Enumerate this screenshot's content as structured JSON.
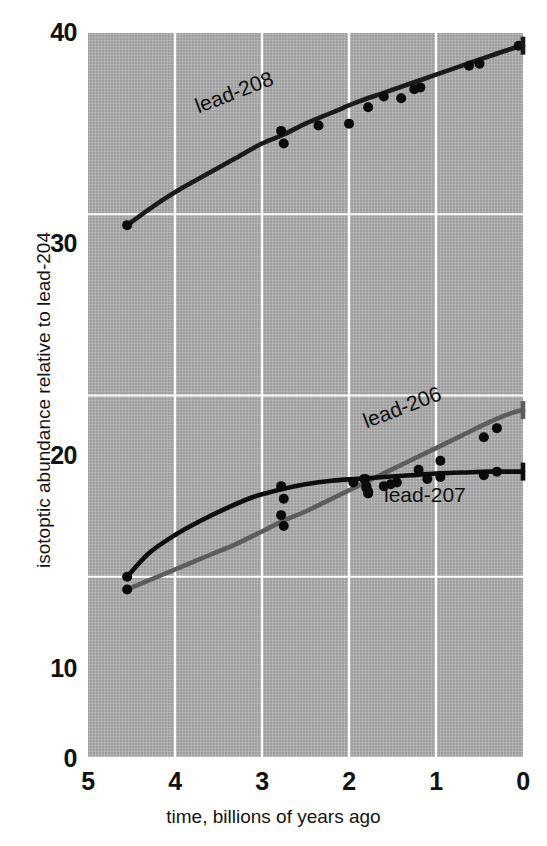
{
  "chart_data": {
    "type": "line",
    "title": "",
    "xlabel": "time, billions of years ago",
    "ylabel": "isotoptic abundance relative to lead-204",
    "xlim": [
      5,
      0
    ],
    "ylim": [
      0,
      40
    ],
    "x_ticks": [
      "5",
      "4",
      "3",
      "2",
      "1",
      "0"
    ],
    "x_tick_values": [
      5,
      4,
      3,
      2,
      1,
      0
    ],
    "y_ticks": [
      "0",
      "10",
      "20",
      "30",
      "40"
    ],
    "y_tick_values": [
      0,
      10,
      20,
      30,
      40
    ],
    "x_axis_reversed": true,
    "grid": true,
    "grid_color": "#ffffff",
    "panel_background": "#a9a9a9",
    "legend": "inline-labels",
    "series": [
      {
        "name": "lead-208",
        "label": "lead-208",
        "color": "#1b1b1b",
        "curve": [
          [
            4.55,
            29.4
          ],
          [
            4.2,
            30.6
          ],
          [
            3.9,
            31.5
          ],
          [
            3.6,
            32.3
          ],
          [
            3.3,
            33.1
          ],
          [
            3.0,
            33.9
          ],
          [
            2.75,
            34.4
          ],
          [
            2.5,
            35.0
          ],
          [
            2.2,
            35.6
          ],
          [
            1.9,
            36.2
          ],
          [
            1.6,
            36.7
          ],
          [
            1.3,
            37.2
          ],
          [
            1.0,
            37.7
          ],
          [
            0.7,
            38.2
          ],
          [
            0.4,
            38.7
          ],
          [
            0.15,
            39.1
          ],
          [
            0.0,
            39.3
          ]
        ],
        "points": [
          [
            4.55,
            29.4
          ],
          [
            2.78,
            34.6
          ],
          [
            2.75,
            33.9
          ],
          [
            2.35,
            34.9
          ],
          [
            2.0,
            35.0
          ],
          [
            1.78,
            35.9
          ],
          [
            1.6,
            36.5
          ],
          [
            1.4,
            36.4
          ],
          [
            1.25,
            36.9
          ],
          [
            1.18,
            37.0
          ],
          [
            0.62,
            38.2
          ],
          [
            0.5,
            38.3
          ],
          [
            0.05,
            39.3
          ]
        ]
      },
      {
        "name": "lead-206",
        "label": "lead-206",
        "color": "#5d5d5d",
        "curve": [
          [
            4.55,
            9.3
          ],
          [
            4.2,
            10.0
          ],
          [
            3.9,
            10.6
          ],
          [
            3.6,
            11.2
          ],
          [
            3.3,
            11.8
          ],
          [
            3.0,
            12.5
          ],
          [
            2.75,
            13.1
          ],
          [
            2.5,
            13.6
          ],
          [
            2.2,
            14.3
          ],
          [
            1.9,
            15.0
          ],
          [
            1.6,
            15.7
          ],
          [
            1.3,
            16.4
          ],
          [
            1.0,
            17.1
          ],
          [
            0.7,
            17.8
          ],
          [
            0.4,
            18.5
          ],
          [
            0.15,
            19.0
          ],
          [
            0.0,
            19.2
          ]
        ],
        "points": [
          [
            4.55,
            9.3
          ],
          [
            2.78,
            13.4
          ],
          [
            2.75,
            12.8
          ],
          [
            1.82,
            15.4
          ],
          [
            1.8,
            15.0
          ],
          [
            1.78,
            14.7
          ],
          [
            1.52,
            15.1
          ],
          [
            1.2,
            15.9
          ],
          [
            0.95,
            16.4
          ],
          [
            0.45,
            17.7
          ],
          [
            0.3,
            18.2
          ]
        ]
      },
      {
        "name": "lead-207",
        "label": "lead-207",
        "color": "#0d0d0d",
        "curve": [
          [
            4.55,
            10.0
          ],
          [
            4.3,
            11.3
          ],
          [
            4.0,
            12.3
          ],
          [
            3.7,
            13.1
          ],
          [
            3.4,
            13.8
          ],
          [
            3.1,
            14.4
          ],
          [
            2.8,
            14.8
          ],
          [
            2.5,
            15.1
          ],
          [
            2.2,
            15.3
          ],
          [
            1.9,
            15.4
          ],
          [
            1.6,
            15.5
          ],
          [
            1.3,
            15.6
          ],
          [
            1.0,
            15.7
          ],
          [
            0.7,
            15.75
          ],
          [
            0.4,
            15.8
          ],
          [
            0.15,
            15.8
          ],
          [
            0.0,
            15.8
          ]
        ],
        "points": [
          [
            4.55,
            10.0
          ],
          [
            2.78,
            15.0
          ],
          [
            2.75,
            14.3
          ],
          [
            1.95,
            15.2
          ],
          [
            1.82,
            15.4
          ],
          [
            1.8,
            14.9
          ],
          [
            1.78,
            14.6
          ],
          [
            1.6,
            15.0
          ],
          [
            1.45,
            15.2
          ],
          [
            1.1,
            15.4
          ],
          [
            0.95,
            15.5
          ],
          [
            0.45,
            15.6
          ],
          [
            0.3,
            15.8
          ]
        ]
      }
    ],
    "end_caps": [
      {
        "series": "lead-208",
        "x": 0,
        "y": 39.3,
        "color": "#1b1b1b"
      },
      {
        "series": "lead-206",
        "x": 0,
        "y": 19.2,
        "color": "#5d5d5d"
      },
      {
        "series": "lead-207",
        "x": 0,
        "y": 15.8,
        "color": "#0d0d0d"
      }
    ]
  },
  "axes": {
    "x_title": "time, billions of years ago",
    "y_title": "isotoptic abundance relative to lead-204",
    "x_tick_labels": [
      "5",
      "4",
      "3",
      "2",
      "1",
      "0"
    ],
    "y_tick_labels": [
      "0",
      "10",
      "20",
      "30",
      "40"
    ]
  },
  "labels": {
    "lead_208": "lead-208",
    "lead_206": "lead-206",
    "lead_207": "lead-207"
  }
}
